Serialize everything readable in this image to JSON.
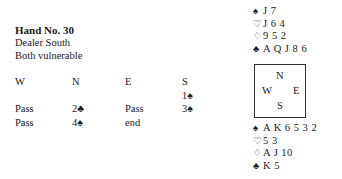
{
  "header": {
    "title": "Hand No. 30",
    "dealer": "Dealer South",
    "vulnerability": "Both vulnerable"
  },
  "auction": {
    "columns": [
      {
        "label": "W",
        "bids": [
          "",
          "Pass",
          "Pass"
        ]
      },
      {
        "label": "N",
        "bids": [
          "",
          "2♣",
          "4♠"
        ]
      },
      {
        "label": "E",
        "bids": [
          "",
          "Pass",
          "end"
        ]
      },
      {
        "label": "S",
        "bids": [
          "1♠",
          "3♠",
          ""
        ]
      }
    ]
  },
  "north": {
    "spades": "J 7",
    "hearts": "J 6 4",
    "diamonds": "9 5 2",
    "clubs": "A Q J 8 6"
  },
  "south": {
    "spades": "A K 6 5 3 2",
    "hearts": "5 3",
    "diamonds": "A J 10",
    "clubs": "K 5"
  },
  "compass": {
    "n": "N",
    "w": "W",
    "e": "E",
    "s": "S"
  },
  "suits": {
    "spade": "♠",
    "heart": "♡",
    "diamond": "♢",
    "club": "♣"
  }
}
